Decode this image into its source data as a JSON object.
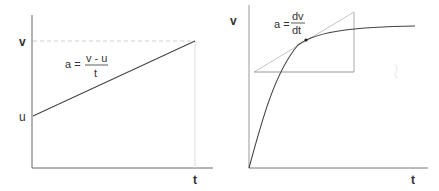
{
  "colors": {
    "axis": "#666666",
    "line": "#444444",
    "guide": "#c8c8c8",
    "tangent": "#bdbdbd",
    "text": "#333333"
  },
  "left_graph": {
    "y_axis_label": "v",
    "initial_label": "u",
    "x_axis_label": "t",
    "formula": {
      "lhs": "a =",
      "numerator": "v - u",
      "denominator": "t"
    },
    "description": "Straight-line velocity-time graph: velocity rises uniformly from u to v over time t"
  },
  "right_graph": {
    "y_axis_label": "v",
    "x_axis_label": "t",
    "formula": {
      "lhs": "a =",
      "numerator": "dv",
      "denominator": "dt"
    },
    "description": "Curved velocity-time graph with tangent line and gradient triangle showing instantaneous acceleration"
  }
}
